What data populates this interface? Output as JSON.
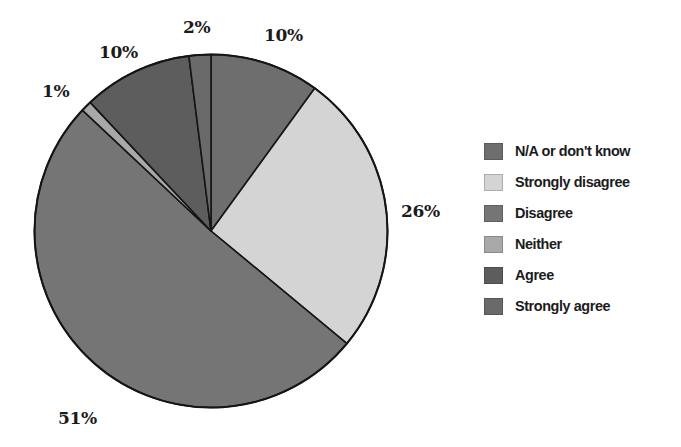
{
  "chart_data": {
    "type": "pie",
    "title": "",
    "xlabel": "",
    "ylabel": "",
    "units": "percent",
    "legend_position": "right",
    "grid": false,
    "start_angle_deg": 0,
    "direction": "clockwise",
    "categories": [
      "N/A or don't know",
      "Strongly disagree",
      "Disagree",
      "Neither",
      "Agree",
      "Strongly agree"
    ],
    "values": [
      10,
      26,
      51,
      1,
      10,
      2
    ],
    "labels": [
      "10%",
      "26%",
      "51%",
      "1%",
      "10%",
      "2%"
    ],
    "colors": [
      "#6e6e6e",
      "#d4d4d4",
      "#757575",
      "#a8a8a8",
      "#5d5d5d",
      "#6a6a6a"
    ],
    "slices": [
      {
        "name": "N/A or don't know",
        "value": 10,
        "label": "10%",
        "color": "#6e6e6e"
      },
      {
        "name": "Strongly disagree",
        "value": 26,
        "label": "26%",
        "color": "#d4d4d4"
      },
      {
        "name": "Disagree",
        "value": 51,
        "label": "51%",
        "color": "#757575"
      },
      {
        "name": "Neither",
        "value": 1,
        "label": "1%",
        "color": "#a8a8a8"
      },
      {
        "name": "Agree",
        "value": 10,
        "label": "10%",
        "color": "#5d5d5d"
      },
      {
        "name": "Strongly agree",
        "value": 2,
        "label": "2%",
        "color": "#6a6a6a"
      }
    ]
  },
  "pie_labels": {
    "slice_1": "10%",
    "slice_2": "26%",
    "slice_3": "51%",
    "slice_4": "1%",
    "slice_5": "10%",
    "slice_6": "2%"
  },
  "legend": {
    "items": [
      {
        "label": "N/A or don't know",
        "color": "#6e6e6e"
      },
      {
        "label": "Strongly disagree",
        "color": "#d4d4d4"
      },
      {
        "label": "Disagree",
        "color": "#757575"
      },
      {
        "label": "Neither",
        "color": "#a8a8a8"
      },
      {
        "label": "Agree",
        "color": "#5d5d5d"
      },
      {
        "label": "Strongly agree",
        "color": "#6a6a6a"
      }
    ]
  },
  "style": {
    "background": "#ffffff",
    "outline": "#151515",
    "text": "#1b1b1b"
  }
}
